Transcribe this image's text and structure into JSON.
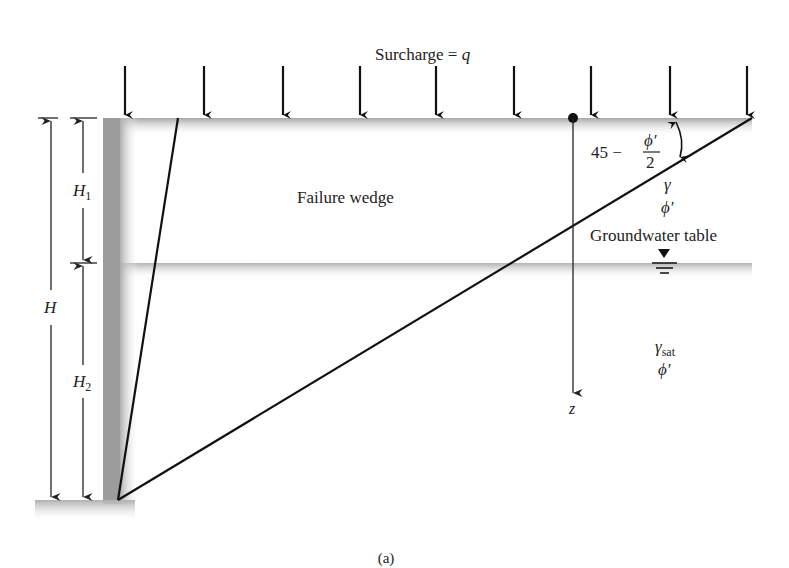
{
  "figure": {
    "caption": "(a)",
    "surcharge_label": "Surcharge = ",
    "surcharge_symbol": "q",
    "failure_wedge_label": "Failure wedge",
    "groundwater_label": "Groundwater table",
    "angle_label_prefix": "45 −",
    "angle_frac_num": "ϕ′",
    "angle_frac_den": "2",
    "upper_soil": {
      "unit_weight": "γ",
      "friction_angle": "ϕ′"
    },
    "lower_soil": {
      "unit_weight": "γ",
      "unit_weight_sub": "sat",
      "friction_angle": "ϕ′"
    },
    "depth_axis_label": "z",
    "dimensions": {
      "total": "H",
      "upper": "H",
      "upper_sub": "1",
      "lower": "H",
      "lower_sub": "2"
    },
    "surcharge_arrow_count": 9,
    "colors": {
      "line": "#111111",
      "ground_shade": "#a8a8a8",
      "wall_shade": "#9a9a9a",
      "background": "#ffffff"
    }
  }
}
